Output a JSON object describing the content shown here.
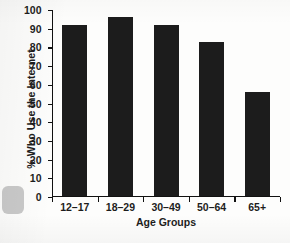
{
  "chart_data": {
    "type": "bar",
    "title": "",
    "xlabel": "Age Groups",
    "ylabel": "% Who Use the Internet",
    "categories": [
      "12–17",
      "18–29",
      "30–49",
      "50–64",
      "65+"
    ],
    "values": [
      92,
      96,
      92,
      83,
      56
    ],
    "ylim": [
      0,
      100
    ],
    "yticks": [
      0,
      10,
      20,
      30,
      40,
      50,
      60,
      70,
      80,
      90,
      100
    ],
    "ytick_labels": [
      "0",
      "10",
      "20",
      "30",
      "40",
      "50",
      "60",
      "70",
      "80",
      "90",
      "100"
    ],
    "grid": false,
    "legend": false,
    "bar_color": "#1c1c1c",
    "axis_color": "#111111",
    "background_color": "#fdfdfc"
  },
  "figure": {
    "ylabel": "% Who Use the Internet",
    "xlabel": "Age Groups"
  }
}
